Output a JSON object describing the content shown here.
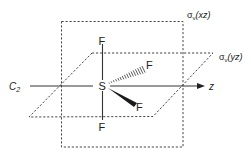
{
  "figure": {
    "molecule": "SF4",
    "central_atom": "S",
    "ligands": [
      {
        "id": "axial-top",
        "label": "F",
        "bond": "line"
      },
      {
        "id": "axial-bottom",
        "label": "F",
        "bond": "line"
      },
      {
        "id": "equatorial-back",
        "label": "F",
        "bond": "hashed-wedge"
      },
      {
        "id": "equatorial-front",
        "label": "F",
        "bond": "solid-wedge"
      }
    ],
    "axis": {
      "rotation_axis_label_main": "C",
      "rotation_axis_label_sub": "2",
      "direction_label": "z"
    },
    "planes": [
      {
        "id": "xz",
        "sigma": "σ",
        "sub": "v",
        "paren": "(xz)"
      },
      {
        "id": "yz",
        "sigma": "σ",
        "sub": "v",
        "paren": "(yz)"
      }
    ],
    "colors": {
      "line": "#333333",
      "text": "#222222",
      "background": "#ffffff"
    }
  }
}
